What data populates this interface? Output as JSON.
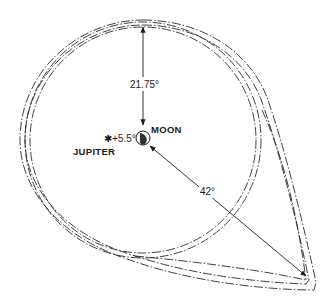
{
  "diagram": {
    "labels": {
      "halo_radius": "21.75°",
      "moon": "MOON",
      "jupiter": "JUPITER",
      "jupiter_offset": "+5.5°",
      "outer_distance": "42°"
    },
    "colors": {
      "ink": "#1a1a1a",
      "background": "#ffffff"
    }
  }
}
